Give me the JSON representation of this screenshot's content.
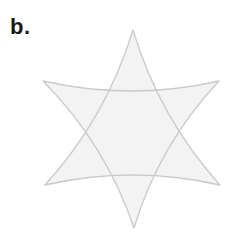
{
  "figure": {
    "label": "b.",
    "canvas": {
      "width": 241,
      "height": 233
    },
    "colors": {
      "background": "#ffffff",
      "shape_fill": "#f3f3f4",
      "shape_stroke": "#c9cacd",
      "label_color": "#1a1a1a"
    },
    "stroke_width": 1.3,
    "shapes": [
      {
        "name": "upward-triangle",
        "vertices": [
          [
            133,
            30
          ],
          [
            45,
            185
          ],
          [
            220,
            185
          ]
        ],
        "edge_sag": 10
      },
      {
        "name": "downward-triangle",
        "vertices": [
          [
            43,
            81
          ],
          [
            219,
            81
          ],
          [
            134,
            228
          ]
        ],
        "edge_sag": 10
      }
    ]
  }
}
